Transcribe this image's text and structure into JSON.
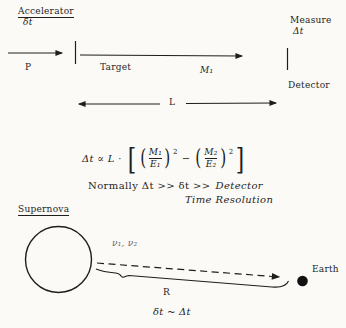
{
  "colors": {
    "background": "#fbfaf7",
    "ink": "#1e1e1e",
    "faded_ink": "#666666"
  },
  "accelerator_diagram": {
    "accelerator_label": "Accelerator",
    "accelerator_time": "δt",
    "beam_label": "P",
    "target_label": "Target",
    "mass_label": "M₁",
    "measure_label": "Measure",
    "measure_quantity": "Δt",
    "detector_label": "Detector",
    "baseline_label": "L"
  },
  "formula": {
    "lhs": "Δt ∝ L ·",
    "open_bracket": "[",
    "open_paren": "(",
    "frac1_numerator": "M₁",
    "frac1_denominator": "E₁",
    "close_paren": ")",
    "exponent": "2",
    "minus": "−",
    "frac2_numerator": "M₂",
    "frac2_denominator": "E₂",
    "close_bracket": "]"
  },
  "note": {
    "line1_prefix": "Normally Δt >> δt >>",
    "line1_emphasis": "Detector",
    "line2": "Time Resolution"
  },
  "supernova_diagram": {
    "supernova_label": "Supernova",
    "neutrino_label": "ν₁, ν₂",
    "distance_label": "R",
    "earth_label": "Earth",
    "relation_label": "δt ~ Δt"
  }
}
